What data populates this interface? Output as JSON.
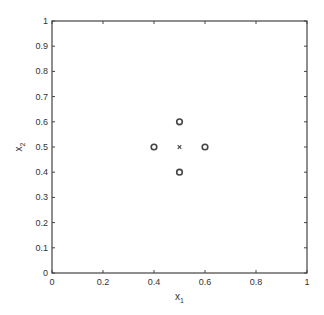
{
  "chart_data": {
    "type": "scatter",
    "title": "",
    "xlabel": "x",
    "xlabel_sub": "1",
    "ylabel": "x",
    "ylabel_sub": "2",
    "xlim": [
      0,
      1
    ],
    "ylim": [
      0,
      1
    ],
    "grid": false,
    "legend": null,
    "x_ticks": [
      0,
      0.2,
      0.4,
      0.6,
      0.8,
      1
    ],
    "x_tick_labels": [
      "0",
      "0.2",
      "0.4",
      "0.6",
      "0.8",
      "1"
    ],
    "y_ticks": [
      0,
      0.1,
      0.2,
      0.3,
      0.4,
      0.5,
      0.6,
      0.7,
      0.8,
      0.9,
      1
    ],
    "y_tick_labels": [
      "0",
      "0.1",
      "0.2",
      "0.3",
      "0.4",
      "0.5",
      "0.6",
      "0.7",
      "0.8",
      "0.9",
      "1"
    ],
    "series": [
      {
        "name": "circles",
        "marker": "o",
        "points": [
          {
            "x": 0.4,
            "y": 0.5
          },
          {
            "x": 0.6,
            "y": 0.5
          },
          {
            "x": 0.5,
            "y": 0.6
          },
          {
            "x": 0.5,
            "y": 0.4
          }
        ]
      },
      {
        "name": "center",
        "marker": "x",
        "points": [
          {
            "x": 0.5,
            "y": 0.5
          }
        ]
      }
    ]
  },
  "colors": {
    "axis": "#444444",
    "marker": "#444444",
    "text": "#333333"
  }
}
